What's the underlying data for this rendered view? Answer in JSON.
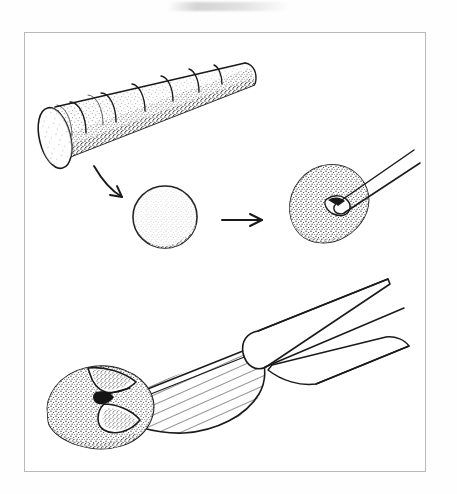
{
  "page": {
    "background_color": "#fefefe",
    "width": 457,
    "height": 494,
    "artifact_name": "scan-smudge"
  },
  "figure": {
    "frame_color": "#b9b9b9",
    "frame_fill": "#ffffff",
    "ink_color": "#1a1a1a",
    "stipple_color": "#2a2a2a",
    "title": "",
    "caption": "",
    "style": "pen-and-ink line drawing with stipple shading"
  },
  "panels": [
    {
      "id": "panel-top",
      "name": "cylinder-slicing",
      "label": "",
      "description": "Stippled dough cylinder marked into equal slices",
      "segment_count": 6
    },
    {
      "id": "panel-middle",
      "name": "ball-to-shaped-piece",
      "label": "",
      "description": "Round dough ball transformed into a teardrop piece notched by a tool",
      "steps": [
        "dough-ball",
        "shaped-piece-with-tool"
      ]
    },
    {
      "id": "panel-bottom",
      "name": "knife-cutting-dough",
      "label": "",
      "description": "Hatched knife blade slicing into a stippled dough piece",
      "hatch_line_count": 22
    }
  ],
  "arrows": [
    {
      "id": "arrow-curved",
      "name": "curved-arrow",
      "direction": "down-right",
      "label": ""
    },
    {
      "id": "arrow-straight",
      "name": "straight-arrow",
      "direction": "right",
      "label": ""
    }
  ],
  "objects": [
    {
      "id": "dough-cylinder",
      "name": "dough-cylinder",
      "label": ""
    },
    {
      "id": "dough-ball",
      "name": "dough-ball",
      "label": ""
    },
    {
      "id": "shaped-dough",
      "name": "shaped-dough-piece",
      "label": ""
    },
    {
      "id": "tool-tip",
      "name": "tool-tip",
      "label": ""
    },
    {
      "id": "knife-blade",
      "name": "knife-blade",
      "label": ""
    },
    {
      "id": "knife-handle",
      "name": "knife-handle",
      "label": ""
    },
    {
      "id": "cut-dough",
      "name": "cut-dough-piece",
      "label": ""
    }
  ]
}
